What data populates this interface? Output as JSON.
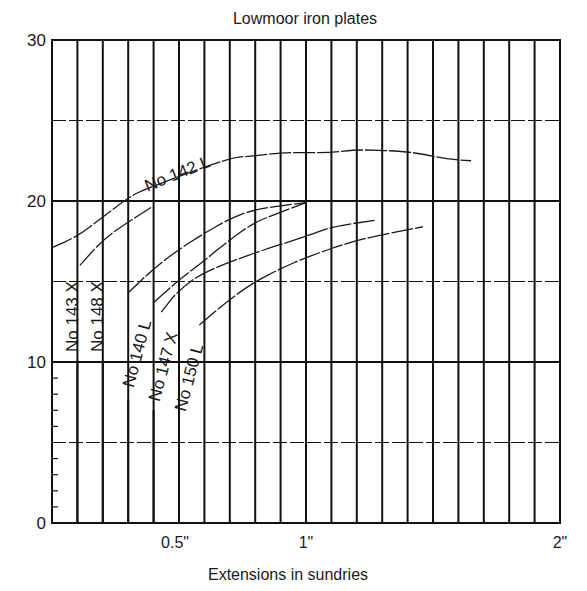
{
  "chart_data": {
    "type": "line",
    "title": "Lowmoor iron plates",
    "xlabel": "Extensions in sundries",
    "ylabel": "",
    "xlim": [
      0,
      2.0
    ],
    "ylim": [
      0,
      30
    ],
    "x_ticks": [
      {
        "value": 0.5,
        "label": "0.5\""
      },
      {
        "value": 1.0,
        "label": "1\""
      },
      {
        "value": 2.0,
        "label": "2\""
      }
    ],
    "y_ticks": [
      {
        "value": 0,
        "label": "0"
      },
      {
        "value": 10,
        "label": "10"
      },
      {
        "value": 20,
        "label": "20"
      },
      {
        "value": 30,
        "label": "30"
      }
    ],
    "grid": {
      "vertical_step": 0.1,
      "horizontal_step": 5,
      "on": true
    },
    "legend": "inline labels",
    "series": [
      {
        "name": "No 142 L",
        "points": [
          [
            0.0,
            17.1
          ],
          [
            0.1,
            17.8
          ],
          [
            0.2,
            19.0
          ],
          [
            0.3,
            20.2
          ],
          [
            0.36,
            20.7
          ],
          [
            0.7,
            22.7
          ],
          [
            0.8,
            22.8
          ],
          [
            0.9,
            23.0
          ],
          [
            1.0,
            23.0
          ],
          [
            1.1,
            23.0
          ],
          [
            1.2,
            23.2
          ],
          [
            1.37,
            23.1
          ],
          [
            1.47,
            22.9
          ],
          [
            1.55,
            22.6
          ],
          [
            1.65,
            22.5
          ]
        ]
      },
      {
        "name": "No 143 X",
        "points": [
          [
            0.11,
            16.0
          ],
          [
            0.2,
            17.6
          ],
          [
            0.3,
            18.7
          ],
          [
            0.39,
            19.6
          ]
        ]
      },
      {
        "name": "No 148 X",
        "points": [
          [
            0.3,
            14.3
          ],
          [
            0.4,
            15.8
          ],
          [
            0.5,
            17.0
          ],
          [
            0.6,
            18.0
          ],
          [
            0.7,
            18.9
          ],
          [
            0.8,
            19.5
          ],
          [
            1.0,
            19.9
          ]
        ]
      },
      {
        "name": "No 140 L",
        "points": [
          [
            0.4,
            13.7
          ],
          [
            0.5,
            15.1
          ],
          [
            0.6,
            16.3
          ],
          [
            0.7,
            17.6
          ],
          [
            0.8,
            18.7
          ],
          [
            0.9,
            19.3
          ],
          [
            1.0,
            19.9
          ]
        ]
      },
      {
        "name": "No 147 X",
        "points": [
          [
            0.43,
            13.1
          ],
          [
            0.5,
            14.5
          ],
          [
            0.6,
            15.6
          ],
          [
            0.8,
            16.8
          ],
          [
            1.0,
            17.8
          ],
          [
            1.1,
            18.4
          ],
          [
            1.27,
            18.8
          ]
        ]
      },
      {
        "name": "No 150 L",
        "points": [
          [
            0.58,
            12.3
          ],
          [
            0.7,
            13.9
          ],
          [
            0.8,
            15.0
          ],
          [
            0.9,
            15.8
          ],
          [
            1.0,
            16.5
          ],
          [
            1.2,
            17.6
          ],
          [
            1.46,
            18.4
          ]
        ]
      }
    ],
    "inline_labels": [
      {
        "text": "No 142 L",
        "anchor_x": 0.36,
        "anchor_y": 20.7,
        "rotation": -22
      },
      {
        "text": "No 143 X",
        "marker_x": 0.1,
        "rotation": -90
      },
      {
        "text": "No 148 X",
        "marker_x": 0.2,
        "rotation": -90
      },
      {
        "text": "No 140 L",
        "marker_x": 0.3,
        "rotation": -75
      },
      {
        "text": "No 147 X",
        "marker_x": 0.4,
        "rotation": -75
      },
      {
        "text": "No 150 L",
        "marker_x": 0.5,
        "rotation": -75
      }
    ]
  }
}
